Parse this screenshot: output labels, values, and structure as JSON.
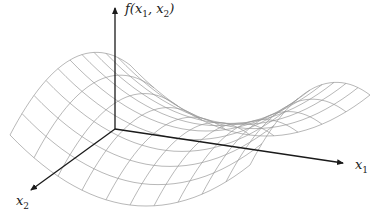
{
  "diagram": {
    "title": "",
    "colors": {
      "axis": "#1a1a1a",
      "mesh": "#9a9a9a",
      "background": "#ffffff"
    },
    "axes": {
      "vertical": {
        "label_prefix": "f(",
        "var1": "x",
        "sub1": "1",
        "sep": ", ",
        "var2": "x",
        "sub2": "2",
        "label_suffix": ")"
      },
      "x1": {
        "var": "x",
        "sub": "1"
      },
      "x2": {
        "var": "x",
        "sub": "2"
      }
    },
    "surface": {
      "type": "saddle-wireframe",
      "grid_lines_u": 10,
      "grid_lines_v": 10
    }
  }
}
